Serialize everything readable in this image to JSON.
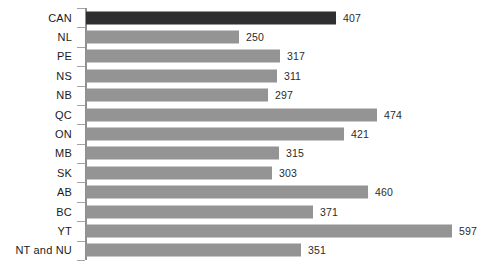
{
  "chart_data": {
    "type": "bar",
    "orientation": "horizontal",
    "title": "",
    "subtitle": "",
    "xlabel": "",
    "ylabel": "",
    "grid": false,
    "legend": null,
    "xlim": [
      0,
      597
    ],
    "axis": {
      "value_axis_visible": false,
      "category_axis_visible": true,
      "tick_marks": true
    },
    "categories": [
      "CAN",
      "NL",
      "PE",
      "NS",
      "NB",
      "QC",
      "ON",
      "MB",
      "SK",
      "AB",
      "BC",
      "YT",
      "NT and NU"
    ],
    "values": [
      407,
      250,
      317,
      311,
      297,
      474,
      421,
      315,
      303,
      460,
      371,
      597,
      351
    ],
    "data_labels": [
      "407",
      "250",
      "317",
      "311",
      "297",
      "474",
      "421",
      "315",
      "303",
      "460",
      "371",
      "597",
      "351"
    ],
    "bar_colors": [
      "#2f2f32",
      "#949494",
      "#949494",
      "#949494",
      "#949494",
      "#949494",
      "#949494",
      "#949494",
      "#949494",
      "#949494",
      "#949494",
      "#949494",
      "#949494"
    ],
    "highlight_category": "CAN",
    "colors": {
      "highlight": "#2f2f32",
      "series": "#949494",
      "axis": "#8f8f8f",
      "tick": "#a3a3a3",
      "text": "#1a1a1a",
      "background": "#ffffff"
    }
  }
}
